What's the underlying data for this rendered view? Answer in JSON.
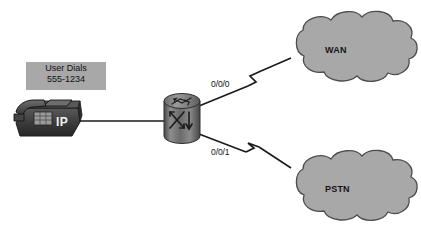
{
  "diagram": {
    "background_color": "#ffffff",
    "line_color": "#1a1a1a",
    "cloud_fill": "#a8a8a8",
    "cloud_stroke": "#4d4d4d",
    "callout_fill": "#a8a8a8"
  },
  "callout": {
    "name": "user-dials-callout",
    "line1": "User Dials",
    "line2": "555-1234"
  },
  "phone": {
    "name": "ip-phone",
    "badge": "IP",
    "body_color": "#3c3c3c",
    "screen_color": "#565656"
  },
  "router": {
    "name": "router",
    "body_color": "#6e6e6e",
    "arrow_color": "#2b2b2b"
  },
  "interfaces": [
    {
      "id": "wan-link",
      "label": "0/0/0"
    },
    {
      "id": "pstn-link",
      "label": "0/0/1"
    }
  ],
  "clouds": [
    {
      "id": "wan",
      "label": "WAN"
    },
    {
      "id": "pstn",
      "label": "PSTN"
    }
  ],
  "links": [
    {
      "id": "phone-to-router",
      "style": "solid",
      "from": "ip-phone",
      "to": "router"
    },
    {
      "id": "router-to-wan",
      "style": "serial-zigzag",
      "from": "router",
      "to": "wan",
      "interface": "0/0/0"
    },
    {
      "id": "router-to-pstn",
      "style": "serial-zigzag",
      "from": "router",
      "to": "pstn",
      "interface": "0/0/1"
    }
  ]
}
